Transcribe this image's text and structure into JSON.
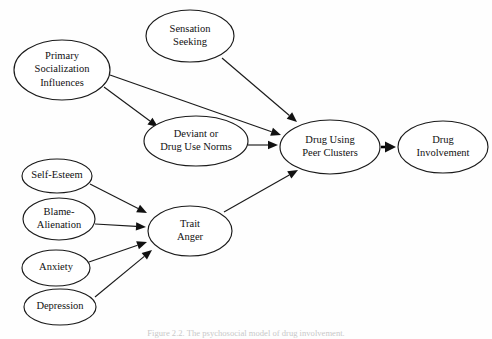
{
  "figure": {
    "caption": "Figure 2.2. The psychosocial model of drug involvement.",
    "background_color": "#fefefe",
    "stroke_color": "#1a1a1a",
    "text_color": "#111111"
  },
  "nodes": [
    {
      "id": "primary-socialization-influences",
      "lines": [
        "Primary",
        "Socialization",
        "Influences"
      ],
      "cx": 62,
      "cy": 70,
      "rx": 48,
      "ry": 30,
      "font_size": 10.5
    },
    {
      "id": "sensation-seeking",
      "lines": [
        "Sensation",
        "Seeking"
      ],
      "cx": 190,
      "cy": 36,
      "rx": 44,
      "ry": 26,
      "font_size": 10.5
    },
    {
      "id": "deviant-or-drug-use-norms",
      "lines": [
        "Deviant or",
        "Drug Use Norms"
      ],
      "cx": 196,
      "cy": 141,
      "rx": 52,
      "ry": 25,
      "font_size": 10.5
    },
    {
      "id": "drug-using-peer-clusters",
      "lines": [
        "Drug Using",
        "Peer Clusters"
      ],
      "cx": 330,
      "cy": 147,
      "rx": 50,
      "ry": 27,
      "font_size": 10.5
    },
    {
      "id": "drug-involvement",
      "lines": [
        "Drug",
        "Involvement"
      ],
      "cx": 443,
      "cy": 147,
      "rx": 45,
      "ry": 26,
      "font_size": 10.5
    },
    {
      "id": "self-esteem",
      "lines": [
        "Self-Esteem"
      ],
      "cx": 57,
      "cy": 176,
      "rx": 35,
      "ry": 17,
      "font_size": 10.5
    },
    {
      "id": "blame-alienation",
      "lines": [
        "Blame-",
        "Alienation"
      ],
      "cx": 59,
      "cy": 219,
      "rx": 36,
      "ry": 21,
      "font_size": 10.5
    },
    {
      "id": "anxiety",
      "lines": [
        "Anxiety"
      ],
      "cx": 56,
      "cy": 268,
      "rx": 34,
      "ry": 18,
      "font_size": 10.5
    },
    {
      "id": "depression",
      "lines": [
        "Depression"
      ],
      "cx": 60,
      "cy": 307,
      "rx": 36,
      "ry": 18,
      "font_size": 10.5
    },
    {
      "id": "trait-anger",
      "lines": [
        "Trait",
        "Anger"
      ],
      "cx": 190,
      "cy": 231,
      "rx": 42,
      "ry": 25,
      "font_size": 10.5
    }
  ],
  "edges": [
    {
      "id": "edge-primary-to-deviant",
      "from": "primary-socialization-influences",
      "to": "deviant-or-drug-use-norms",
      "x1": 104,
      "y1": 87,
      "x2": 158,
      "y2": 127,
      "bold": false
    },
    {
      "id": "edge-primary-to-peer-clusters",
      "from": "primary-socialization-influences",
      "to": "drug-using-peer-clusters",
      "x1": 110,
      "y1": 75,
      "x2": 281,
      "y2": 135,
      "bold": false
    },
    {
      "id": "edge-sensation-to-peer-clusters",
      "from": "sensation-seeking",
      "to": "drug-using-peer-clusters",
      "x1": 222,
      "y1": 58,
      "x2": 297,
      "y2": 122,
      "bold": false
    },
    {
      "id": "edge-deviant-to-peer-clusters",
      "from": "deviant-or-drug-use-norms",
      "to": "drug-using-peer-clusters",
      "x1": 248,
      "y1": 145,
      "x2": 278,
      "y2": 145,
      "bold": false
    },
    {
      "id": "edge-trait-anger-to-peer-clusters",
      "from": "trait-anger",
      "to": "drug-using-peer-clusters",
      "x1": 224,
      "y1": 212,
      "x2": 298,
      "y2": 170,
      "bold": false
    },
    {
      "id": "edge-peer-clusters-to-involvement",
      "from": "drug-using-peer-clusters",
      "to": "drug-involvement",
      "x1": 381,
      "y1": 147,
      "x2": 396,
      "y2": 147,
      "bold": true
    },
    {
      "id": "edge-self-esteem-to-trait-anger",
      "from": "self-esteem",
      "to": "trait-anger",
      "x1": 90,
      "y1": 184,
      "x2": 147,
      "y2": 213,
      "bold": false
    },
    {
      "id": "edge-blame-alienation-to-trait-anger",
      "from": "blame-alienation",
      "to": "trait-anger",
      "x1": 95,
      "y1": 224,
      "x2": 146,
      "y2": 227,
      "bold": false
    },
    {
      "id": "edge-anxiety-to-trait-anger",
      "from": "anxiety",
      "to": "trait-anger",
      "x1": 89,
      "y1": 262,
      "x2": 147,
      "y2": 242,
      "bold": false
    },
    {
      "id": "edge-depression-to-trait-anger",
      "from": "depression",
      "to": "trait-anger",
      "x1": 95,
      "y1": 297,
      "x2": 152,
      "y2": 250,
      "bold": false
    }
  ]
}
